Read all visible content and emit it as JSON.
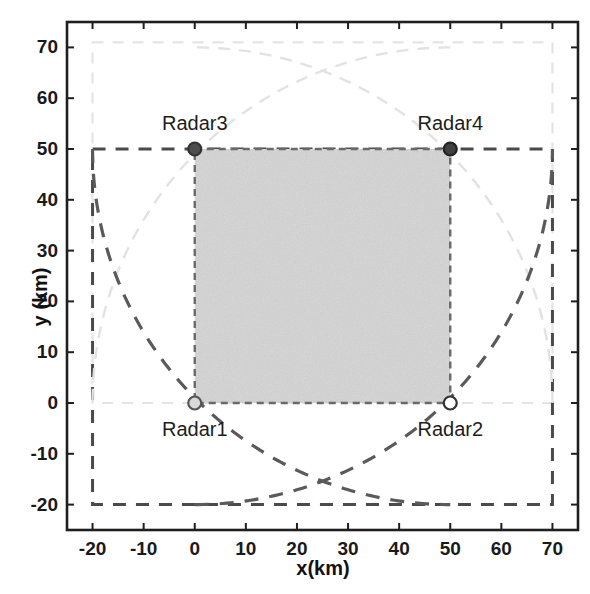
{
  "figure": {
    "background": "#ffffff",
    "axes_color": "#222222"
  },
  "chart_data": {
    "type": "scatter",
    "title": "",
    "xlabel": "x(km)",
    "ylabel": "y (km)",
    "xlim": [
      -25,
      75
    ],
    "ylim": [
      -25,
      75
    ],
    "xticks": [
      -20,
      -10,
      0,
      10,
      20,
      30,
      40,
      50,
      60,
      70
    ],
    "xticklabels": [
      "-20",
      "-10",
      "0",
      "10",
      "20",
      "30",
      "40",
      "50",
      "60",
      "70"
    ],
    "yticks": [
      -20,
      -10,
      0,
      10,
      20,
      30,
      40,
      50,
      60,
      70
    ],
    "yticklabels": [
      "-20",
      "-10",
      "0",
      "10",
      "20",
      "30",
      "40",
      "50",
      "60",
      "70"
    ],
    "grid": false,
    "legend": null,
    "series": [
      {
        "name": "Radars",
        "marker": "circle",
        "points": [
          {
            "label": "Radar1",
            "x": 0,
            "y": 0,
            "marker_fill": "#d9d9d9",
            "marker_edge": "#555555",
            "label_dx": 0,
            "label_dy": -26
          },
          {
            "label": "Radar2",
            "x": 50,
            "y": 0,
            "marker_fill": "#ffffff",
            "marker_edge": "#333333",
            "label_dx": 0,
            "label_dy": -26
          },
          {
            "label": "Radar3",
            "x": 0,
            "y": 50,
            "marker_fill": "#4d4d4d",
            "marker_edge": "#333333",
            "label_dx": 0,
            "label_dy": 26
          },
          {
            "label": "Radar4",
            "x": 50,
            "y": 50,
            "marker_fill": "#404040",
            "marker_edge": "#222222",
            "label_dx": 0,
            "label_dy": 26
          }
        ]
      }
    ],
    "annotations": {
      "coverage_radius_km": 70,
      "shaded_region": {
        "name": "common-coverage-area",
        "x_range": [
          0,
          50
        ],
        "y_range": [
          0,
          50
        ],
        "fill": "#d4d4d4"
      },
      "dark_dashed_bounding_box": {
        "x_range": [
          -20,
          70
        ],
        "y_range": [
          -20,
          50
        ],
        "color": "#4a4a4a"
      },
      "light_dashed_bounding_box": {
        "x_range": [
          -20,
          70
        ],
        "y_range": [
          0,
          71
        ],
        "color": "#e2e2e2"
      },
      "arcs": [
        {
          "center": [
            0,
            0
          ],
          "radius": 70,
          "start_deg": 0,
          "end_deg": 90,
          "color": "#e2e2e2"
        },
        {
          "center": [
            50,
            0
          ],
          "radius": 70,
          "start_deg": 90,
          "end_deg": 180,
          "color": "#e2e2e2"
        },
        {
          "center": [
            0,
            50
          ],
          "radius": 70,
          "start_deg": 270,
          "end_deg": 360,
          "color": "#5a5a5a"
        },
        {
          "center": [
            50,
            50
          ],
          "radius": 70,
          "start_deg": 180,
          "end_deg": 270,
          "color": "#5a5a5a"
        }
      ]
    }
  }
}
